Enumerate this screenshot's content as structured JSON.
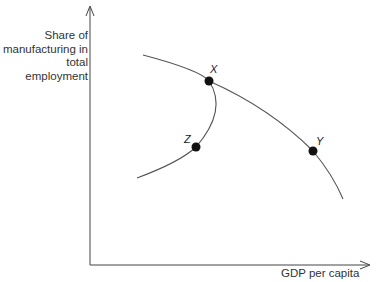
{
  "axes": {
    "y_label_lines": [
      "Share of",
      "manufacturing in",
      "total",
      "employment"
    ],
    "x_label": "GDP per capita"
  },
  "points": {
    "X": "X",
    "Y": "Y",
    "Z": "Z"
  },
  "colors": {
    "line": "#444444",
    "point": "#111111",
    "text": "#333333"
  }
}
